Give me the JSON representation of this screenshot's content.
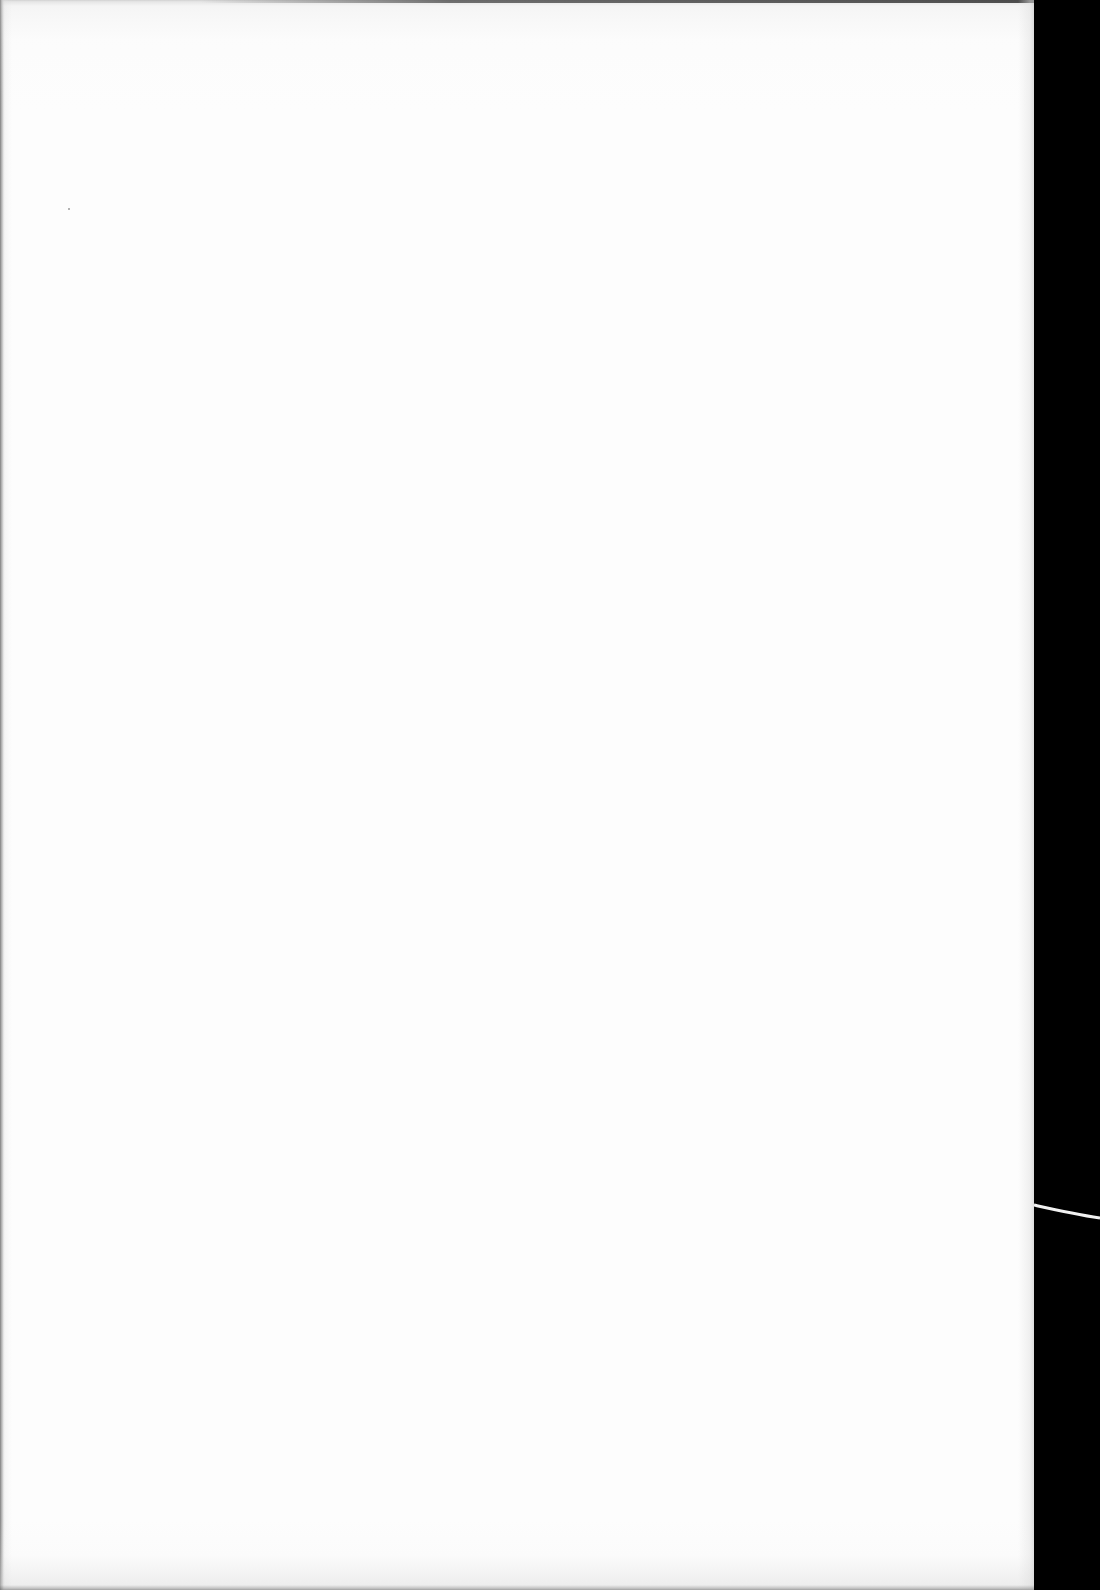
{
  "page": {
    "type": "blank-scanned-sheet",
    "text_content": "",
    "paper_color": "#fdfdfd",
    "background_color": "#000000"
  }
}
